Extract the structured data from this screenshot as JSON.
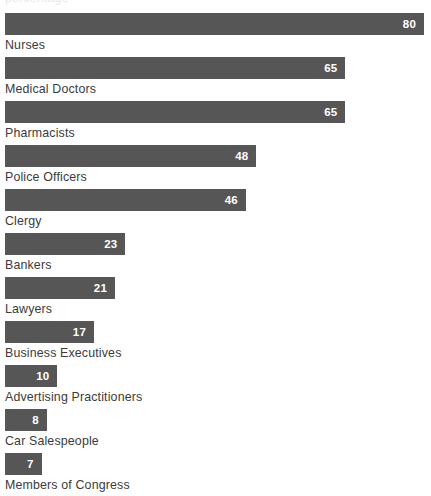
{
  "clipped_title": "percentage",
  "colors": {
    "bar": "#565656",
    "bar_value_text": "#ffffff",
    "category_label_text": "#3b3b3b",
    "background": "#ffffff"
  },
  "chart_data": {
    "type": "bar",
    "orientation": "horizontal",
    "title": "",
    "subtitle": "",
    "xlabel": "",
    "ylabel": "",
    "xlim": [
      0,
      80
    ],
    "grid": false,
    "legend": false,
    "value_labels_inside_bars": true,
    "categories": [
      "Nurses",
      "Medical Doctors",
      "Pharmacists",
      "Police Officers",
      "Clergy",
      "Bankers",
      "Lawyers",
      "Business Executives",
      "Advertising Practitioners",
      "Car Salespeople",
      "Members of Congress"
    ],
    "values": [
      80,
      65,
      65,
      48,
      46,
      23,
      21,
      17,
      10,
      8,
      7
    ],
    "bars": [
      {
        "label": "Nurses",
        "value": 80,
        "value_text": "80"
      },
      {
        "label": "Medical Doctors",
        "value": 65,
        "value_text": "65"
      },
      {
        "label": "Pharmacists",
        "value": 65,
        "value_text": "65"
      },
      {
        "label": "Police Officers",
        "value": 48,
        "value_text": "48"
      },
      {
        "label": "Clergy",
        "value": 46,
        "value_text": "46"
      },
      {
        "label": "Bankers",
        "value": 23,
        "value_text": "23"
      },
      {
        "label": "Lawyers",
        "value": 21,
        "value_text": "21"
      },
      {
        "label": "Business Executives",
        "value": 17,
        "value_text": "17"
      },
      {
        "label": "Advertising Practitioners",
        "value": 10,
        "value_text": "10"
      },
      {
        "label": "Car Salespeople",
        "value": 8,
        "value_text": "8"
      },
      {
        "label": "Members of Congress",
        "value": 7,
        "value_text": "7"
      }
    ]
  }
}
